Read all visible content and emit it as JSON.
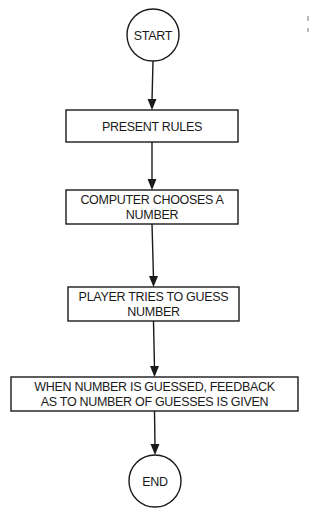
{
  "diagram": {
    "type": "flowchart",
    "nodes": [
      {
        "id": "start",
        "shape": "circle",
        "lines": [
          "START"
        ]
      },
      {
        "id": "rules",
        "shape": "rect",
        "lines": [
          "PRESENT RULES"
        ]
      },
      {
        "id": "choose",
        "shape": "rect",
        "lines": [
          "COMPUTER CHOOSES A",
          "NUMBER"
        ]
      },
      {
        "id": "guess",
        "shape": "rect",
        "lines": [
          "PLAYER TRIES TO GUESS",
          "NUMBER"
        ]
      },
      {
        "id": "feedback",
        "shape": "rect",
        "lines": [
          "WHEN NUMBER IS GUESSED, FEEDBACK",
          "AS TO NUMBER OF GUESSES IS GIVEN"
        ]
      },
      {
        "id": "end",
        "shape": "circle",
        "lines": [
          "END"
        ]
      }
    ],
    "edges": [
      {
        "from": "start",
        "to": "rules"
      },
      {
        "from": "rules",
        "to": "choose"
      },
      {
        "from": "choose",
        "to": "guess"
      },
      {
        "from": "guess",
        "to": "feedback"
      },
      {
        "from": "feedback",
        "to": "end"
      }
    ]
  }
}
